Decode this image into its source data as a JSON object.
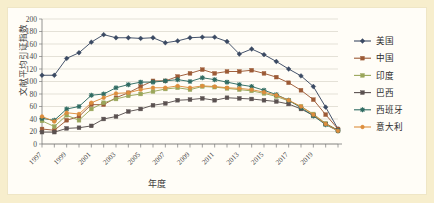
{
  "chart_data": {
    "type": "line",
    "title": "",
    "xlabel": "年度",
    "ylabel": "文献平均引证指数",
    "xlim": [
      1997,
      2021
    ],
    "ylim": [
      0,
      200
    ],
    "ytick_step": 20,
    "yticks": [
      0,
      20,
      40,
      60,
      80,
      100,
      120,
      140,
      160,
      180,
      200
    ],
    "x": [
      1997,
      1998,
      1999,
      2000,
      2001,
      2002,
      2003,
      2004,
      2005,
      2006,
      2007,
      2008,
      2009,
      2010,
      2011,
      2012,
      2013,
      2014,
      2015,
      2016,
      2017,
      2018,
      2019,
      2020,
      2021
    ],
    "xtick_labels": [
      "1997",
      "1999",
      "2001",
      "2003",
      "2005",
      "2007",
      "2009",
      "2011",
      "2013",
      "2015",
      "2017",
      "2019"
    ],
    "grid": true,
    "legend_position": "right",
    "series": [
      {
        "name": "美国",
        "color": "#3b4a63",
        "marker": "diamond",
        "values": [
          110,
          110,
          137,
          146,
          163,
          175,
          170,
          170,
          169,
          170,
          162,
          165,
          170,
          171,
          171,
          164,
          144,
          152,
          143,
          132,
          120,
          109,
          92,
          59,
          24
        ]
      },
      {
        "name": "中国",
        "color": "#9c5a36",
        "marker": "square",
        "values": [
          24,
          22,
          38,
          44,
          63,
          63,
          74,
          82,
          92,
          101,
          101,
          108,
          113,
          119,
          113,
          116,
          116,
          118,
          113,
          107,
          98,
          86,
          71,
          47,
          24
        ]
      },
      {
        "name": "印度",
        "color": "#9aa65a",
        "marker": "square",
        "values": [
          37,
          28,
          46,
          38,
          56,
          66,
          72,
          77,
          80,
          84,
          88,
          90,
          87,
          92,
          91,
          89,
          87,
          85,
          81,
          76,
          69,
          60,
          48,
          33,
          22
        ]
      },
      {
        "name": "巴西",
        "color": "#5a5150",
        "marker": "square",
        "values": [
          19,
          19,
          25,
          26,
          29,
          40,
          44,
          52,
          56,
          62,
          65,
          70,
          71,
          73,
          70,
          74,
          73,
          72,
          70,
          68,
          64,
          56,
          46,
          32,
          22
        ]
      },
      {
        "name": "西班牙",
        "color": "#2f6b62",
        "marker": "star",
        "values": [
          41,
          38,
          56,
          60,
          78,
          80,
          90,
          95,
          99,
          99,
          101,
          103,
          100,
          106,
          103,
          99,
          95,
          92,
          86,
          79,
          70,
          58,
          45,
          31,
          21
        ]
      },
      {
        "name": "意大利",
        "color": "#dd8e3d",
        "marker": "circle",
        "values": [
          44,
          36,
          50,
          48,
          66,
          74,
          81,
          82,
          87,
          90,
          90,
          93,
          90,
          93,
          92,
          90,
          89,
          87,
          83,
          78,
          70,
          60,
          47,
          32,
          21
        ]
      }
    ]
  },
  "legend": {
    "items": [
      {
        "label": "美国"
      },
      {
        "label": "中国"
      },
      {
        "label": "印度"
      },
      {
        "label": "巴西"
      },
      {
        "label": "西班牙"
      },
      {
        "label": "意大利"
      }
    ]
  }
}
